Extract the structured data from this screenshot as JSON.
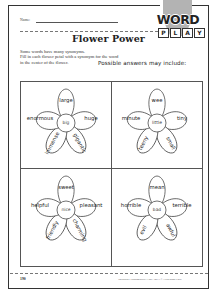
{
  "header": {
    "name_label": "Name:",
    "logo": {
      "word": "WORD",
      "play_letters": [
        "P",
        "L",
        "A",
        "Y"
      ]
    },
    "title": "Flower Power"
  },
  "instructions": {
    "lines": [
      "Some words have many synonyms.",
      "Fill in each flower petal with a synonym for the word",
      "in the center of the flower."
    ],
    "answers_note": "Possible answers may include:"
  },
  "flowers": [
    {
      "center": "big",
      "petals": {
        "top": "large",
        "left": "enormous",
        "right": "huge",
        "bottom_left": "immense",
        "bottom_right": "gigantic"
      }
    },
    {
      "center": "little",
      "petals": {
        "top": "wee",
        "left": "minute",
        "right": "tiny",
        "bottom_left": "teeny",
        "bottom_right": "small"
      }
    },
    {
      "center": "nice",
      "petals": {
        "top": "sweet",
        "left": "helpful",
        "right": "pleasant",
        "bottom_left": "friendly",
        "bottom_right": "charming"
      }
    },
    {
      "center": "bad",
      "petals": {
        "top": "mean",
        "left": "horrible",
        "right": "terrible",
        "bottom_left": "evil",
        "bottom_right": "awful"
      }
    }
  ],
  "footer": {
    "page_number": "190",
    "copyright": "Vocabulary Fundamentals • TMC 3963 • © Evan-Moor Corp."
  }
}
